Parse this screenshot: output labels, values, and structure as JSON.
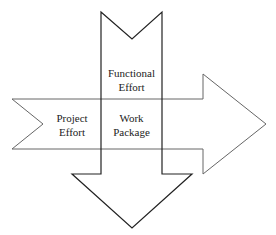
{
  "diagram": {
    "vertical_arrow": {
      "label_line1": "Functional",
      "label_line2": "Effort"
    },
    "horizontal_arrow": {
      "label_line1": "Project",
      "label_line2": "Effort"
    },
    "intersection": {
      "label_line1": "Work",
      "label_line2": "Package"
    },
    "colors": {
      "stroke": "#222222",
      "fill": "#ffffff",
      "horizontal_stroke": "#555555"
    }
  }
}
